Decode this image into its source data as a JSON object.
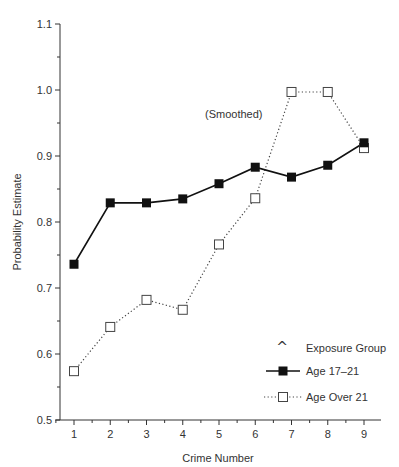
{
  "chart_data": {
    "type": "line",
    "title": "",
    "annotation": "(Smoothed)",
    "xlabel": "Crime Number",
    "ylabel": "Probability Estimate",
    "x": [
      1,
      2,
      3,
      4,
      5,
      6,
      7,
      8,
      9
    ],
    "xticks": [
      "1",
      "2",
      "3",
      "4",
      "5",
      "6",
      "7",
      "8",
      "9"
    ],
    "yticks": [
      "0.5",
      "0.6",
      "0.7",
      "0.8",
      "0.9",
      "1.0",
      "1.1"
    ],
    "ylim": [
      0.5,
      1.1
    ],
    "xlim": [
      0.5,
      9.45
    ],
    "grid": false,
    "legend_position": "lower right",
    "legend_title": "Exposure Group",
    "series": [
      {
        "name": "Age 17–21",
        "style": "solid line, filled square markers",
        "values": [
          0.736,
          0.829,
          0.829,
          0.835,
          0.858,
          0.883,
          0.868,
          0.886,
          0.92
        ]
      },
      {
        "name": "Age Over 21",
        "style": "dotted line, open square markers",
        "values": [
          0.574,
          0.641,
          0.682,
          0.667,
          0.766,
          0.836,
          0.997,
          0.997,
          0.912
        ]
      }
    ]
  },
  "labels": {
    "annotation": "(Smoothed)",
    "xlabel": "Crime Number",
    "ylabel": "Probability Estimate",
    "legend_title": "Exposure Group",
    "legend_series_1": "Age 17–21",
    "legend_series_2": "Age Over 21"
  }
}
